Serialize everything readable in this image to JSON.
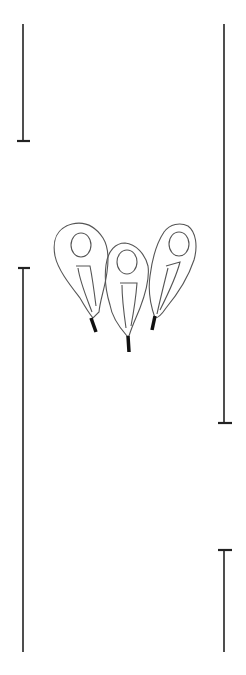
{
  "figure": {
    "stroke_color": "#222222",
    "flame_outline_color": "#555555",
    "background": "#ffffff"
  }
}
